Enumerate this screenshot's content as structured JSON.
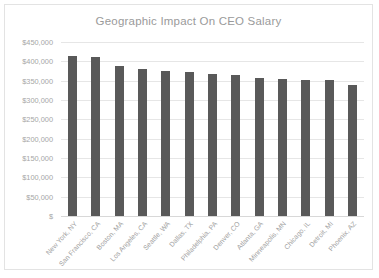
{
  "chart_data": {
    "type": "bar",
    "title": "Geographic Impact On CEO Salary",
    "xlabel": "",
    "ylabel": "",
    "ylim": [
      0,
      450000
    ],
    "ytick_step": 50000,
    "grid": true,
    "legend": null,
    "bar_color": "#595959",
    "categories": [
      "New York, NY",
      "San Francisco, CA",
      "Boston, MA",
      "Los Angeles, CA",
      "Seattle, WA",
      "Dallas, TX",
      "Philadelphia, PA",
      "Denver, CO",
      "Atlanta, GA",
      "Minneapolis, MN",
      "Chicago, IL",
      "Detroit, MI",
      "Phoenix, AZ"
    ],
    "values": [
      415000,
      412000,
      387000,
      380000,
      375000,
      373000,
      368000,
      364000,
      357000,
      355000,
      352000,
      351000,
      340000
    ],
    "ytick_labels": [
      "$450,000",
      "$400,000",
      "$350,000",
      "$300,000",
      "$250,000",
      "$200,000",
      "$150,000",
      "$100,000",
      "$50,000",
      "$"
    ],
    "ytick_values": [
      450000,
      400000,
      350000,
      300000,
      250000,
      200000,
      150000,
      100000,
      50000,
      0
    ]
  }
}
